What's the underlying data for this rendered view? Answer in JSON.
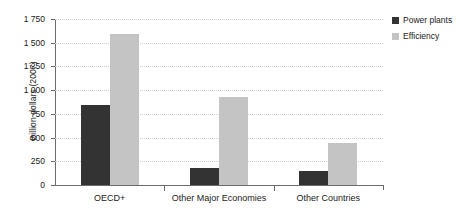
{
  "chart_data": {
    "type": "bar",
    "title": "",
    "subtitle": "",
    "xlabel": "",
    "ylabel": "Billion dollars (2007)",
    "categories": [
      "OECD+",
      "Other Major Economies",
      "Other Countries"
    ],
    "series": [
      {
        "name": "Power plants",
        "color": "#333333",
        "values": [
          840,
          175,
          145
        ]
      },
      {
        "name": "Efficiency",
        "color": "#c4c4c4",
        "values": [
          1590,
          930,
          440
        ]
      }
    ],
    "ylim": [
      0,
      1750
    ],
    "ytick_values": [
      0,
      250,
      500,
      750,
      1000,
      1250,
      1500,
      1750
    ],
    "ytick_labels": [
      "0",
      "250",
      "500",
      "750",
      "1 000",
      "1 250",
      "1 500",
      "1 750"
    ],
    "grid": true,
    "grid_axis": "y",
    "legend_position": "right-top",
    "annotations": []
  },
  "legend": {
    "entries": [
      {
        "label": "Power plants"
      },
      {
        "label": "Efficiency"
      }
    ]
  },
  "axes": {
    "y_title": "Billion dollars (2007)"
  }
}
